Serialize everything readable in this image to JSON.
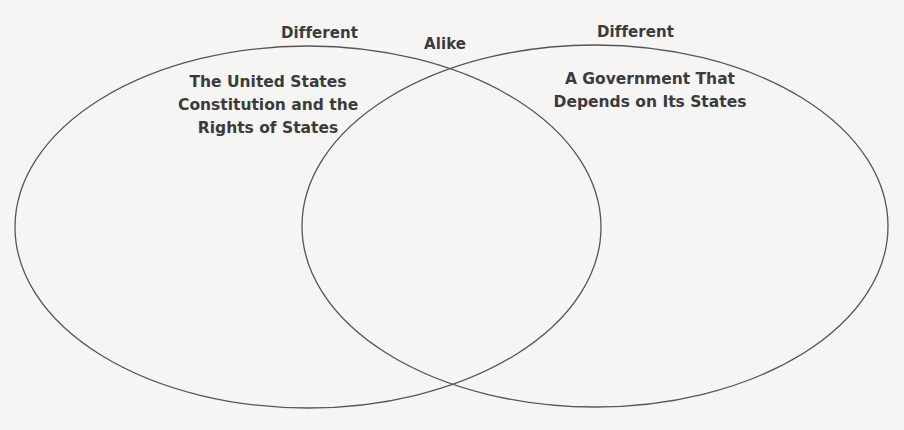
{
  "diagram": {
    "type": "venn",
    "heading_partial": "...pare and Contrast: Comparing Governments...",
    "region_labels": {
      "left": "Different",
      "middle": "Alike",
      "right": "Different"
    },
    "circles": [
      {
        "id": "left",
        "title_lines": [
          "The United States",
          "Constitution and the",
          "Rights of States"
        ],
        "cx": 308,
        "cy": 227,
        "rx": 293,
        "ry": 181
      },
      {
        "id": "right",
        "title_lines": [
          "A Government That",
          "Depends on Its States"
        ],
        "cx": 595,
        "cy": 226,
        "rx": 293,
        "ry": 181
      }
    ],
    "colors": {
      "background": "#f5f5f3",
      "outline": "#555555",
      "text": "#3b3b3b"
    }
  }
}
